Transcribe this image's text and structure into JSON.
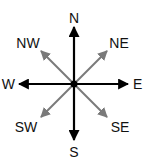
{
  "diagram": {
    "type": "compass-rose",
    "center": {
      "x": 74,
      "y": 84
    },
    "colors": {
      "cardinal": "#000000",
      "intercardinal": "#7a7a7a",
      "label": "#111111",
      "background": "#ffffff"
    },
    "cardinal": {
      "north": {
        "label": "N"
      },
      "east": {
        "label": "E"
      },
      "south": {
        "label": "S"
      },
      "west": {
        "label": "W"
      }
    },
    "intercardinal": {
      "northeast": {
        "label": "NE"
      },
      "southeast": {
        "label": "SE"
      },
      "southwest": {
        "label": "SW"
      },
      "northwest": {
        "label": "NW"
      }
    }
  }
}
